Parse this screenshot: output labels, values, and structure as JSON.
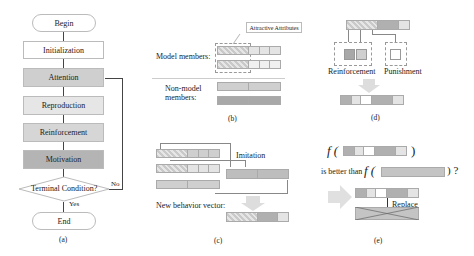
{
  "panel_a": {
    "caption": "(a)",
    "nodes": {
      "begin": "Begin",
      "init": "Initialization",
      "attention": "Attention",
      "reproduction": "Reproduction",
      "reinforcement": "Reinforcement",
      "motivation": "Motivation",
      "condition": "Terminal Condition?",
      "end": "End"
    },
    "labels": {
      "yes": "Yes",
      "no": "No"
    }
  },
  "panel_b": {
    "caption": "(b)",
    "callout": "Attractive Attributes",
    "model_label": "Model members:",
    "nonmodel_label_1": "Non-model",
    "nonmodel_label_2": "members:"
  },
  "panel_c": {
    "caption": "(c)",
    "imitation": "Imitation",
    "new_vector": "New behavior vector:"
  },
  "panel_d": {
    "caption": "(d)",
    "reinforcement": "Reinforcement",
    "punishment": "Punishment"
  },
  "panel_e": {
    "caption": "(e)",
    "f1": "f (",
    "close1": ")",
    "better": "is better than",
    "f2": "f (",
    "close2": ") ?",
    "replace": "Replace"
  },
  "colors": {
    "light": "#e4e4e4",
    "medium": "#cfcfcf",
    "dark": "#a8a8a8",
    "arrow": "#d8d8d8"
  }
}
